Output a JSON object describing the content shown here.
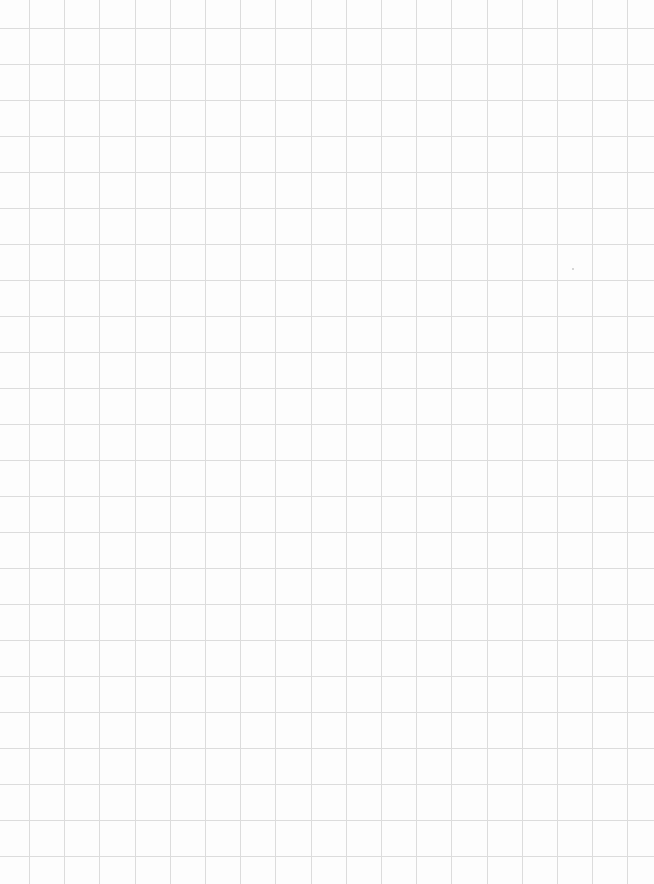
{
  "page": {
    "type": "grid-paper",
    "width": 654,
    "height": 884,
    "background_color": "#fdfdfd",
    "line_color": "#dcdcdc",
    "line_width": 1
  },
  "grid": {
    "vertical_lines": {
      "start": 29,
      "spacing": 35.2,
      "count": 18
    },
    "horizontal_lines": {
      "start": 28,
      "spacing": 36,
      "count": 24
    }
  },
  "marks": [
    {
      "x": 572,
      "y": 268
    }
  ]
}
